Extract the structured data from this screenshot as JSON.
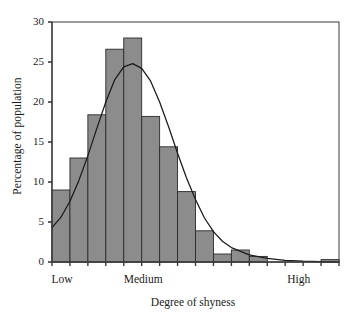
{
  "chart_data": {
    "type": "bar",
    "title": "",
    "subtitle": "",
    "xlabel": "Degree of shyness",
    "ylabel": "Percentage of population",
    "ylim": [
      0,
      30
    ],
    "yticks": [
      0,
      5,
      10,
      15,
      20,
      25,
      30
    ],
    "ytick_labels": [
      "0",
      "5",
      "10",
      "15",
      "20",
      "25",
      "30"
    ],
    "xtick_labels": [
      "Low",
      "Medium",
      "High"
    ],
    "xtick_positions": [
      0.5,
      5.0,
      13.7
    ],
    "grid": false,
    "legend": null,
    "n_bins": 16,
    "categories": [
      "1",
      "2",
      "3",
      "4",
      "5",
      "6",
      "7",
      "8",
      "9",
      "10",
      "11",
      "12",
      "13",
      "14",
      "15",
      "16"
    ],
    "values": [
      9.0,
      13.0,
      18.4,
      26.6,
      28.0,
      18.2,
      14.4,
      8.8,
      3.9,
      1.0,
      1.5,
      0.7,
      0.0,
      0.0,
      0.0,
      0.3
    ],
    "bar_color": "#8c8c8c",
    "bar_edge_color": "#2b2b2b",
    "axis_color": "#3a3a3a",
    "series": [
      {
        "name": "Percentage of population",
        "type": "bar",
        "values": [
          9.0,
          13.0,
          18.4,
          26.6,
          28.0,
          18.2,
          14.4,
          8.8,
          3.9,
          1.0,
          1.5,
          0.7,
          0.0,
          0.0,
          0.0,
          0.3
        ]
      },
      {
        "name": "Normal curve overlay",
        "type": "line",
        "color": "#1a1a1a",
        "peak_value": 24.8,
        "peak_x": 4.55,
        "x": [
          0.0,
          0.5,
          1.0,
          1.5,
          2.0,
          2.5,
          3.0,
          3.5,
          4.0,
          4.5,
          5.0,
          5.5,
          6.0,
          6.5,
          7.0,
          7.5,
          8.0,
          8.5,
          9.0,
          9.5,
          10.0,
          11.0,
          12.0,
          13.0,
          14.0,
          15.0,
          16.0
        ],
        "values": [
          4.3,
          5.6,
          7.6,
          10.2,
          13.3,
          16.7,
          20.0,
          22.8,
          24.4,
          24.8,
          24.2,
          22.6,
          20.0,
          16.9,
          13.6,
          10.5,
          7.8,
          5.5,
          3.8,
          2.6,
          1.8,
          0.9,
          0.45,
          0.2,
          0.1,
          0.05,
          0.0
        ]
      }
    ]
  },
  "axes": {
    "y_title": "Percentage of population",
    "x_title": "Degree of shyness"
  }
}
